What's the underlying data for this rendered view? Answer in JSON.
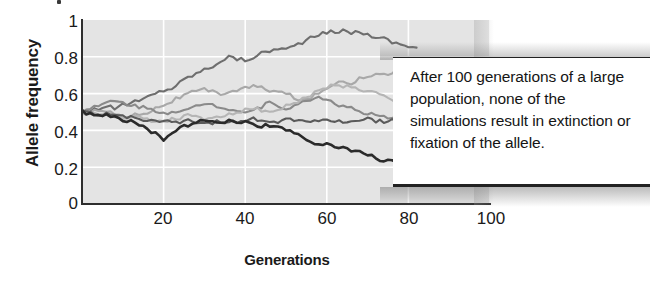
{
  "figure": {
    "y_axis_title": "Allele frequency",
    "x_axis_title": "Generations",
    "annotation": "After 100 generations of a large population, none of the simulations result in extinction or fixation of the allele."
  },
  "chart_data": {
    "type": "line",
    "title": "",
    "xlabel": "Generations",
    "ylabel": "Allele frequency",
    "xlim": [
      0,
      100
    ],
    "ylim": [
      0,
      1
    ],
    "xticks": [
      20,
      40,
      60,
      80,
      100
    ],
    "yticks": [
      0,
      0.2,
      0.4,
      0.6,
      0.8,
      1
    ],
    "grid": true,
    "grid_color": "#ffffff",
    "plot_background": "#e4e4e4",
    "legend": "none",
    "note": "Six independent genetic-drift simulation replicates in a large population, all starting at allele frequency 0.5; drawn data ends near generation 82.",
    "series": [
      {
        "name": "replicate-1",
        "color": "#6e6e6e",
        "x": [
          0,
          2,
          4,
          6,
          8,
          10,
          12,
          14,
          16,
          18,
          20,
          22,
          24,
          26,
          28,
          30,
          32,
          34,
          36,
          38,
          40,
          42,
          44,
          46,
          48,
          50,
          52,
          54,
          56,
          58,
          60,
          62,
          64,
          66,
          68,
          70,
          72,
          74,
          76,
          78,
          80,
          82
        ],
        "y": [
          0.5,
          0.51,
          0.52,
          0.53,
          0.52,
          0.54,
          0.55,
          0.56,
          0.58,
          0.6,
          0.62,
          0.63,
          0.66,
          0.69,
          0.71,
          0.73,
          0.75,
          0.78,
          0.8,
          0.79,
          0.78,
          0.8,
          0.82,
          0.83,
          0.85,
          0.84,
          0.86,
          0.88,
          0.9,
          0.92,
          0.93,
          0.94,
          0.94,
          0.93,
          0.94,
          0.92,
          0.91,
          0.9,
          0.88,
          0.87,
          0.86,
          0.85
        ]
      },
      {
        "name": "replicate-2",
        "color": "#a8a8a8",
        "x": [
          0,
          2,
          4,
          6,
          8,
          10,
          12,
          14,
          16,
          18,
          20,
          22,
          24,
          26,
          28,
          30,
          32,
          34,
          36,
          38,
          40,
          42,
          44,
          46,
          48,
          50,
          52,
          54,
          56,
          58,
          60,
          62,
          64,
          66,
          68,
          70,
          72,
          74,
          76,
          78,
          80,
          82
        ],
        "y": [
          0.5,
          0.5,
          0.51,
          0.5,
          0.49,
          0.48,
          0.48,
          0.49,
          0.5,
          0.52,
          0.54,
          0.56,
          0.58,
          0.6,
          0.61,
          0.62,
          0.61,
          0.6,
          0.61,
          0.62,
          0.63,
          0.64,
          0.63,
          0.62,
          0.61,
          0.6,
          0.58,
          0.56,
          0.58,
          0.6,
          0.63,
          0.66,
          0.67,
          0.66,
          0.68,
          0.7,
          0.71,
          0.7,
          0.72,
          0.73,
          0.7,
          0.65
        ]
      },
      {
        "name": "replicate-3",
        "color": "#8a8a8a",
        "x": [
          0,
          2,
          4,
          6,
          8,
          10,
          12,
          14,
          16,
          18,
          20,
          22,
          24,
          26,
          28,
          30,
          32,
          34,
          36,
          38,
          40,
          42,
          44,
          46,
          48,
          50,
          52,
          54,
          56,
          58,
          60,
          62,
          64,
          66,
          68,
          70,
          72,
          74,
          76,
          78,
          80,
          82
        ],
        "y": [
          0.5,
          0.52,
          0.53,
          0.55,
          0.56,
          0.55,
          0.54,
          0.53,
          0.52,
          0.51,
          0.5,
          0.49,
          0.5,
          0.51,
          0.53,
          0.55,
          0.54,
          0.53,
          0.52,
          0.51,
          0.5,
          0.51,
          0.53,
          0.55,
          0.54,
          0.52,
          0.53,
          0.55,
          0.57,
          0.58,
          0.57,
          0.55,
          0.53,
          0.52,
          0.5,
          0.49,
          0.48,
          0.47,
          0.46,
          0.46,
          0.47,
          0.47
        ]
      },
      {
        "name": "replicate-4",
        "color": "#b5b5b5",
        "x": [
          0,
          2,
          4,
          6,
          8,
          10,
          12,
          14,
          16,
          18,
          20,
          22,
          24,
          26,
          28,
          30,
          32,
          34,
          36,
          38,
          40,
          42,
          44,
          46,
          48,
          50,
          52,
          54,
          56,
          58,
          60,
          62,
          64,
          66,
          68,
          70,
          72,
          74,
          76,
          78,
          80,
          82
        ],
        "y": [
          0.5,
          0.49,
          0.48,
          0.48,
          0.47,
          0.47,
          0.48,
          0.47,
          0.46,
          0.45,
          0.45,
          0.46,
          0.47,
          0.48,
          0.47,
          0.46,
          0.47,
          0.48,
          0.49,
          0.5,
          0.51,
          0.52,
          0.51,
          0.5,
          0.51,
          0.53,
          0.55,
          0.57,
          0.59,
          0.61,
          0.63,
          0.65,
          0.64,
          0.63,
          0.62,
          0.61,
          0.6,
          0.58,
          0.56,
          0.52,
          0.48,
          0.46
        ]
      },
      {
        "name": "replicate-5",
        "color": "#5a5a5a",
        "x": [
          0,
          2,
          4,
          6,
          8,
          10,
          12,
          14,
          16,
          18,
          20,
          22,
          24,
          26,
          28,
          30,
          32,
          34,
          36,
          38,
          40,
          42,
          44,
          46,
          48,
          50,
          52,
          54,
          56,
          58,
          60,
          62,
          64,
          66,
          68,
          70,
          72,
          74,
          76,
          78,
          80,
          82
        ],
        "y": [
          0.5,
          0.5,
          0.49,
          0.49,
          0.48,
          0.48,
          0.47,
          0.46,
          0.46,
          0.45,
          0.45,
          0.44,
          0.44,
          0.45,
          0.45,
          0.44,
          0.44,
          0.45,
          0.45,
          0.44,
          0.45,
          0.46,
          0.46,
          0.45,
          0.45,
          0.46,
          0.46,
          0.45,
          0.45,
          0.46,
          0.46,
          0.45,
          0.44,
          0.45,
          0.46,
          0.46,
          0.45,
          0.45,
          0.46,
          0.46,
          0.46,
          0.46
        ]
      },
      {
        "name": "replicate-6",
        "color": "#2b2b2b",
        "x": [
          0,
          2,
          4,
          6,
          8,
          10,
          12,
          14,
          16,
          18,
          20,
          22,
          24,
          26,
          28,
          30,
          32,
          34,
          36,
          38,
          40,
          42,
          44,
          46,
          48,
          50,
          52,
          54,
          56,
          58,
          60,
          62,
          64,
          66,
          68,
          70,
          72,
          74,
          76,
          78,
          80,
          82
        ],
        "y": [
          0.5,
          0.49,
          0.49,
          0.48,
          0.47,
          0.46,
          0.45,
          0.43,
          0.41,
          0.38,
          0.34,
          0.38,
          0.41,
          0.43,
          0.45,
          0.45,
          0.44,
          0.45,
          0.45,
          0.44,
          0.44,
          0.43,
          0.42,
          0.43,
          0.42,
          0.4,
          0.38,
          0.36,
          0.34,
          0.33,
          0.33,
          0.31,
          0.3,
          0.29,
          0.28,
          0.27,
          0.25,
          0.24,
          0.24,
          0.23,
          0.22,
          0.19
        ]
      }
    ]
  }
}
